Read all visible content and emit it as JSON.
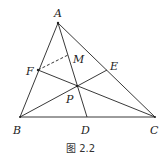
{
  "figure": {
    "caption": "图 2.2",
    "points": {
      "A": {
        "label": "A",
        "x": 58,
        "y": 23
      },
      "B": {
        "label": "B",
        "x": 20,
        "y": 117
      },
      "C": {
        "label": "C",
        "x": 155,
        "y": 117
      },
      "D": {
        "label": "D",
        "x": 87,
        "y": 117
      },
      "E": {
        "label": "E",
        "x": 107,
        "y": 70
      },
      "F": {
        "label": "F",
        "x": 38,
        "y": 70
      },
      "P": {
        "label": "P",
        "x": 77,
        "y": 86
      },
      "M": {
        "label": "M",
        "x": 69,
        "y": 54
      }
    },
    "segments": [
      {
        "from": "A",
        "to": "B",
        "style": "solid"
      },
      {
        "from": "B",
        "to": "C",
        "style": "solid"
      },
      {
        "from": "A",
        "to": "C",
        "style": "solid"
      },
      {
        "from": "A",
        "to": "D",
        "style": "solid"
      },
      {
        "from": "B",
        "to": "E",
        "style": "solid"
      },
      {
        "from": "C",
        "to": "F",
        "style": "solid"
      },
      {
        "from": "F",
        "to": "M",
        "style": "dashed"
      }
    ]
  }
}
